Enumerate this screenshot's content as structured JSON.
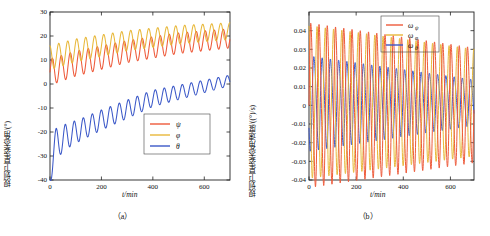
{
  "figure": {
    "panels": [
      {
        "caption": "（a）",
        "ylabel": "规划卫星姿态角/(°)",
        "xlabel": "t/min",
        "legend": [
          "ψ",
          "φ",
          "θ"
        ]
      },
      {
        "caption": "（b）",
        "ylabel": "规划卫星姿态角速度/((°)/s)",
        "xlabel": "t/min",
        "legend": [
          "ω_ψ",
          "ω_φ",
          "ω_θ"
        ]
      }
    ]
  },
  "colors": {
    "psi": "#ee5a3a",
    "phi": "#e8b83a",
    "theta": "#3b58c8",
    "axis": "#222222",
    "background": "#ffffff"
  },
  "chart_data": [
    {
      "type": "line",
      "title": "",
      "subtitle": "(a)",
      "xlabel": "t/min",
      "ylabel": "规划卫星姿态角/(°)",
      "xlim": [
        0,
        700
      ],
      "ylim": [
        -40,
        30
      ],
      "xticks": [
        0,
        200,
        400,
        600
      ],
      "yticks": [
        -40,
        -30,
        -20,
        -10,
        0,
        10,
        20,
        30
      ],
      "grid": false,
      "legend_position": "lower-right",
      "series": [
        {
          "name": "ψ",
          "color": "#ee5a3a",
          "description": "oscillation of amplitude ~10 deg around a mean that rises from ~5 to ~17 deg, period ~35 min",
          "x": [
            0,
            10,
            20,
            30,
            40,
            50,
            60,
            70,
            80,
            90,
            100,
            120,
            140,
            160,
            180,
            200,
            220,
            240,
            260,
            280,
            300,
            320,
            340,
            360,
            380,
            400,
            420,
            440,
            460,
            480,
            500,
            520,
            540,
            560,
            580,
            600,
            620,
            640,
            660,
            680,
            700
          ],
          "y": [
            0,
            9,
            2,
            10,
            3,
            11,
            4,
            12,
            5,
            13,
            6,
            7,
            14,
            8,
            15,
            9,
            16,
            10,
            17,
            11,
            18,
            12,
            19,
            13,
            20,
            14,
            20,
            15,
            21,
            16,
            21,
            17,
            22,
            18,
            22,
            18,
            23,
            19,
            23,
            19,
            23
          ]
        },
        {
          "name": "φ",
          "color": "#e8b83a",
          "description": "oscillation of amplitude ~10 deg around a mean that rises from ~8 to ~20 deg, leads ψ slightly, period ~35 min",
          "x": [
            0,
            10,
            20,
            30,
            40,
            50,
            60,
            70,
            80,
            90,
            100,
            120,
            140,
            160,
            180,
            200,
            220,
            240,
            260,
            280,
            300,
            320,
            340,
            360,
            380,
            400,
            420,
            440,
            460,
            480,
            500,
            520,
            540,
            560,
            580,
            600,
            620,
            640,
            660,
            680,
            700
          ],
          "y": [
            8,
            16,
            9,
            17,
            10,
            18,
            11,
            19,
            12,
            20,
            13,
            14,
            21,
            15,
            22,
            16,
            23,
            17,
            23,
            18,
            24,
            19,
            24,
            20,
            24,
            20,
            24,
            21,
            24,
            21,
            25,
            22,
            25,
            22,
            25,
            22,
            25,
            22,
            25,
            22,
            25
          ]
        },
        {
          "name": "θ",
          "color": "#3b58c8",
          "description": "starts near -37 deg, oscillates with amplitude ~7 deg and rising mean, reaching ~3 deg at 700 min",
          "x": [
            0,
            10,
            20,
            30,
            40,
            50,
            60,
            70,
            80,
            90,
            100,
            120,
            140,
            160,
            180,
            200,
            220,
            240,
            260,
            280,
            300,
            320,
            340,
            360,
            380,
            400,
            420,
            440,
            460,
            480,
            500,
            520,
            540,
            560,
            580,
            600,
            620,
            640,
            660,
            680,
            700
          ],
          "y": [
            -37,
            -20,
            -27,
            -19,
            -25,
            -18,
            -24,
            -17,
            -23,
            -16,
            -22,
            -20,
            -14,
            -18,
            -12,
            -16,
            -11,
            -14,
            -9,
            -12,
            -8,
            -10,
            -6,
            -8,
            -5,
            -6,
            -3,
            -5,
            -2,
            -3,
            -1,
            -2,
            0,
            -1,
            1,
            0,
            2,
            1,
            2,
            1,
            3
          ]
        }
      ]
    },
    {
      "type": "line",
      "title": "",
      "subtitle": "(b)",
      "xlabel": "t/min",
      "ylabel": "规划卫星姿态角速度/((°)/s)",
      "xlim": [
        0,
        700
      ],
      "ylim": [
        -0.04,
        0.05
      ],
      "xticks": [
        0,
        200,
        400,
        600
      ],
      "yticks": [
        -0.04,
        -0.03,
        -0.02,
        -0.01,
        0,
        0.01,
        0.02,
        0.03,
        0.04
      ],
      "grid": false,
      "legend_position": "upper-right",
      "series": [
        {
          "name": "ω_ψ",
          "color": "#ee5a3a",
          "description": "oscillation with amplitude decaying from ±0.043 to ±0.030 (deg/s), period ~35 min",
          "amplitude_start": 0.043,
          "amplitude_end": 0.03,
          "period_min": 35,
          "mean": 0.0
        },
        {
          "name": "ω_φ",
          "color": "#e8b83a",
          "description": "oscillation with amplitude decaying from ±0.040 to ±0.028 (deg/s), phase shifted from ω_ψ",
          "amplitude_start": 0.04,
          "amplitude_end": 0.028,
          "period_min": 35,
          "mean": 0.0
        },
        {
          "name": "ω_θ",
          "color": "#3b58c8",
          "description": "oscillation with amplitude decaying from ±0.025 to ±0.012 (deg/s), mean slightly above zero",
          "amplitude_start": 0.025,
          "amplitude_end": 0.012,
          "period_min": 35,
          "mean": 0.002
        }
      ]
    }
  ]
}
